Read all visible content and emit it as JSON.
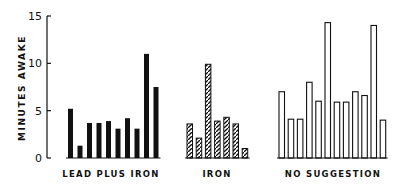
{
  "chart_data": {
    "type": "bar",
    "title": "",
    "xlabel": "",
    "ylabel": "MINUTES AWAKE",
    "ylim": [
      0,
      15
    ],
    "yticks": [
      0,
      5,
      10,
      15
    ],
    "grid": false,
    "legend": null,
    "series": [
      {
        "name": "LEAD PLUS IRON",
        "style": "solid-black",
        "values": [
          5.2,
          1.3,
          3.7,
          3.7,
          3.9,
          3.1,
          4.2,
          3.1,
          11.0,
          7.5
        ]
      },
      {
        "name": "IRON",
        "style": "hatched",
        "values": [
          3.6,
          2.1,
          9.9,
          3.9,
          4.3,
          3.6,
          1.0
        ]
      },
      {
        "name": "NO SUGGESTION",
        "style": "outline",
        "values": [
          7.0,
          4.1,
          4.1,
          8.0,
          6.0,
          14.3,
          5.9,
          5.9,
          7.0,
          6.6,
          14.0,
          4.0
        ]
      }
    ]
  },
  "labels": {
    "ylabel": "MINUTES AWAKE",
    "groups": [
      "LEAD PLUS IRON",
      "IRON",
      "NO SUGGESTION"
    ]
  },
  "colors": {
    "ink": "#111111",
    "background": "#ffffff"
  }
}
